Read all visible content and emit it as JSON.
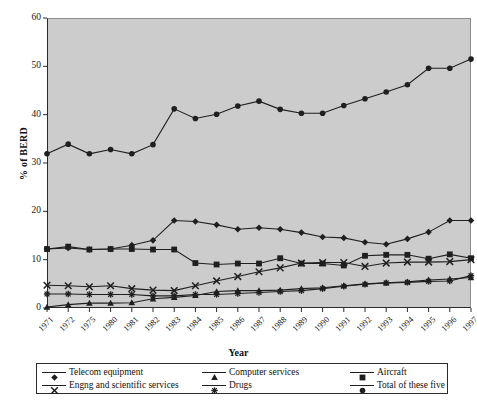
{
  "chart_data": {
    "type": "line",
    "title": "",
    "xlabel": "Year",
    "ylabel": "% of BERD",
    "ylim": [
      0,
      60
    ],
    "yticks": [
      0,
      10,
      20,
      30,
      40,
      50,
      60
    ],
    "grid": false,
    "legend_position": "bottom",
    "categories": [
      "1971",
      "1972",
      "1975",
      "1980",
      "1981",
      "1982",
      "1983",
      "1984",
      "1985",
      "1986",
      "1987",
      "1988",
      "1989",
      "1990",
      "1991",
      "1992",
      "1993",
      "1994",
      "1995",
      "1996",
      "1997"
    ],
    "series": [
      {
        "name": "Telecom equipment",
        "marker": "diamond",
        "values": [
          12.2,
          12.4,
          12.1,
          12.2,
          13.0,
          14.0,
          18.1,
          17.9,
          17.2,
          16.3,
          16.6,
          16.3,
          15.6,
          14.7,
          14.5,
          13.6,
          13.2,
          14.3,
          15.7,
          18.1,
          18.1
        ]
      },
      {
        "name": "Computer services",
        "marker": "triangle",
        "values": [
          0.2,
          0.7,
          1.0,
          1.0,
          1.1,
          1.9,
          2.2,
          2.6,
          3.4,
          3.6,
          3.6,
          3.7,
          4.0,
          4.2,
          4.6,
          5.0,
          5.2,
          5.4,
          5.8,
          6.0,
          6.3
        ]
      },
      {
        "name": "Aircraft",
        "marker": "square",
        "values": [
          12.2,
          12.7,
          12.1,
          12.2,
          12.2,
          12.1,
          12.1,
          9.3,
          9.0,
          9.2,
          9.2,
          10.3,
          9.2,
          9.2,
          8.8,
          10.8,
          11.0,
          11.0,
          10.2,
          11.1,
          10.3
        ]
      },
      {
        "name": "Engng and scientific services",
        "marker": "x",
        "values": [
          4.7,
          4.6,
          4.4,
          4.6,
          4.0,
          3.7,
          3.6,
          4.6,
          5.6,
          6.5,
          7.5,
          8.3,
          9.3,
          9.4,
          9.4,
          8.6,
          9.3,
          9.5,
          9.5,
          9.6,
          10.0
        ]
      },
      {
        "name": "Drugs",
        "marker": "star",
        "values": [
          2.9,
          2.9,
          2.8,
          2.8,
          2.8,
          2.5,
          2.5,
          2.8,
          2.8,
          3.0,
          3.2,
          3.4,
          3.6,
          4.0,
          4.5,
          4.9,
          5.2,
          5.3,
          5.5,
          5.6,
          6.7
        ]
      },
      {
        "name": "Total of these five",
        "marker": "circle",
        "values": [
          31.9,
          33.9,
          31.9,
          32.8,
          31.9,
          33.8,
          41.2,
          39.2,
          40.1,
          41.8,
          42.8,
          41.1,
          40.3,
          40.3,
          41.9,
          43.3,
          44.7,
          46.2,
          49.6,
          49.6,
          51.5
        ]
      }
    ]
  },
  "axes": {
    "y_title": "% of BERD",
    "x_title": "Year"
  },
  "legend": {
    "entries": [
      {
        "label": "Telecom equipment",
        "marker": "diamond"
      },
      {
        "label": "Computer services",
        "marker": "triangle"
      },
      {
        "label": "Aircraft",
        "marker": "square"
      },
      {
        "label": "Engng and scientific services",
        "marker": "x"
      },
      {
        "label": "Drugs",
        "marker": "star"
      },
      {
        "label": "Total of these five",
        "marker": "circle"
      }
    ]
  },
  "colors": {
    "plot_background": "#cccccc",
    "line": "#1f1f1f",
    "axis": "#2b2b2b",
    "page_background": "#ffffff"
  }
}
